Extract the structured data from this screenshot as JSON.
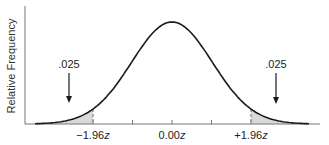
{
  "chart_data": {
    "type": "area",
    "title": "",
    "xlabel": "",
    "ylabel": "Relative Frequency",
    "distribution": "standard normal",
    "x_range": [
      -3.4,
      3.4
    ],
    "tick_positions": [
      -1.96,
      -0.98,
      0.0,
      0.98,
      1.96
    ],
    "tick_labels": [
      {
        "value": -1.96,
        "text": "−1.96",
        "suffix": "z"
      },
      {
        "value": 0.0,
        "text": "0.00",
        "suffix": "z"
      },
      {
        "value": 1.96,
        "text": "+1.96",
        "suffix": "z"
      }
    ],
    "shaded_regions": [
      {
        "from": -3.4,
        "to": -1.96,
        "area": 0.025,
        "label": ".025",
        "side": "left"
      },
      {
        "from": 1.96,
        "to": 3.4,
        "area": 0.025,
        "label": ".025",
        "side": "right"
      }
    ],
    "critical_values": [
      -1.96,
      1.96
    ],
    "grid": false,
    "legend": null,
    "colors": {
      "curve": "#1a1a1a",
      "shade": "#d9d9d9",
      "dashed": "#8a8a8a",
      "axis": "#777777"
    }
  },
  "labels": {
    "y_axis": "Relative Frequency",
    "left_tail": ".025",
    "right_tail": ".025",
    "tick_neg": "−1.96",
    "tick_zero": "0.00",
    "tick_pos": "+1.96",
    "z": "z"
  }
}
